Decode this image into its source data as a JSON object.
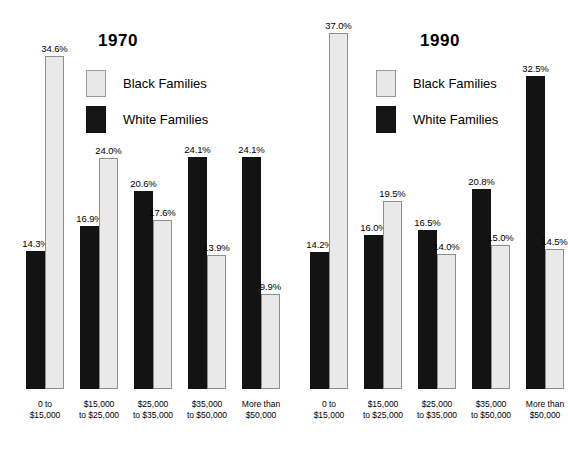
{
  "chart_data": [
    {
      "type": "bar",
      "title": "1970",
      "xlabel": "",
      "ylabel": "",
      "ylim": [
        0,
        37
      ],
      "grid": false,
      "legend_position": "top-center",
      "value_suffix": "%",
      "categories": [
        "0 to\n$15,000",
        "$15,000\nto $25,000",
        "$25,000\nto $35,000",
        "$35,000\nto $50,000",
        "More than\n$50,000"
      ],
      "category_lines": [
        [
          "0 to",
          "$15,000"
        ],
        [
          "$15,000",
          "to $25,000"
        ],
        [
          "$25,000",
          "to $35,000"
        ],
        [
          "$35,000",
          "to $50,000"
        ],
        [
          "More than",
          "$50,000"
        ]
      ],
      "series": [
        {
          "name": "White Families",
          "color": "#131313",
          "values": [
            14.3,
            16.9,
            20.6,
            24.1,
            24.1
          ],
          "labels": [
            "14.3%",
            "16.9%",
            "20.6%",
            "24.1%",
            "24.1%"
          ]
        },
        {
          "name": "Black Families",
          "color": "#e9e9e9",
          "values": [
            34.6,
            24.0,
            17.6,
            13.9,
            9.9
          ],
          "labels": [
            "34.6%",
            "24.0%",
            "17.6%",
            "13.9%",
            "9.9%"
          ]
        }
      ]
    },
    {
      "type": "bar",
      "title": "1990",
      "xlabel": "",
      "ylabel": "",
      "ylim": [
        0,
        37
      ],
      "grid": false,
      "legend_position": "top-center",
      "value_suffix": "%",
      "categories": [
        "0 to\n$15,000",
        "$15,000\nto $25,000",
        "$25,000\nto $35,000",
        "$35,000\nto $50,000",
        "More than\n$50,000"
      ],
      "category_lines": [
        [
          "0 to",
          "$15,000"
        ],
        [
          "$15,000",
          "to $25,000"
        ],
        [
          "$25,000",
          "to $35,000"
        ],
        [
          "$35,000",
          "to $50,000"
        ],
        [
          "More than",
          "$50,000"
        ]
      ],
      "series": [
        {
          "name": "White Families",
          "color": "#131313",
          "values": [
            14.2,
            16.0,
            16.5,
            20.8,
            32.5
          ],
          "labels": [
            "14.2%",
            "16.0%",
            "16.5%",
            "20.8%",
            "32.5%"
          ]
        },
        {
          "name": "Black Families",
          "color": "#e9e9e9",
          "values": [
            37.0,
            19.5,
            14.0,
            15.0,
            14.5
          ],
          "labels": [
            "37.0%",
            "19.5%",
            "14.0%",
            "15.0%",
            "14.5%"
          ]
        }
      ]
    }
  ],
  "panels": {
    "left": {
      "title": "1970",
      "legend": [
        {
          "label": "Black Families",
          "swatch": "light"
        },
        {
          "label": "White Families",
          "swatch": "dark"
        }
      ]
    },
    "right": {
      "title": "1990",
      "legend": [
        {
          "label": "Black Families",
          "swatch": "light"
        },
        {
          "label": "White Families",
          "swatch": "dark"
        }
      ]
    }
  },
  "colors": {
    "black_families_fill": "#e9e9e9",
    "black_families_border": "#8f8f8f",
    "white_families_fill": "#131313",
    "background": "#ffffff",
    "text": "#000000"
  }
}
